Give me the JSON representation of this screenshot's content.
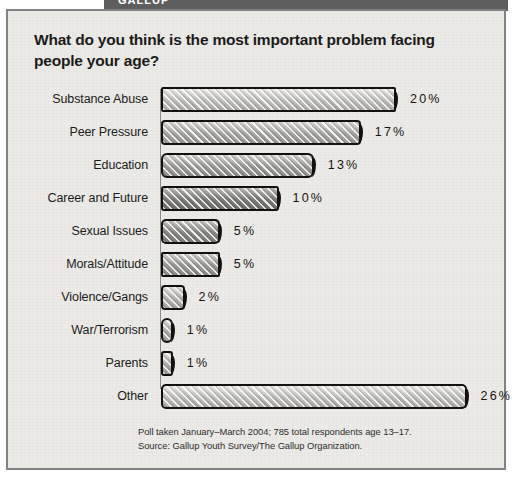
{
  "banner": {
    "text": "GALLUP"
  },
  "panel": {
    "title": "What do you think is the most important problem facing people your age?",
    "footnote_line1": "Poll taken January–March 2004; 785 total respondents age 13–17.",
    "footnote_line2": "Source: Gallup Youth Survey/The Gallup Organization."
  },
  "colors": {
    "paper": "#eceae6",
    "panel_border": "#828282",
    "banner": "#5d5d5d",
    "ink": "#14100d",
    "axis": "#8d8d8d"
  },
  "chart_data": {
    "type": "bar",
    "orientation": "horizontal",
    "title": "What do you think is the most important problem facing people your age?",
    "xlabel": "",
    "ylabel": "",
    "xlim": [
      0,
      26
    ],
    "grid": false,
    "legend": null,
    "value_suffix": "%",
    "categories": [
      "Substance Abuse",
      "Peer Pressure",
      "Education",
      "Career and Future",
      "Sexual Issues",
      "Morals/Attitude",
      "Violence/Gangs",
      "War/Terrorism",
      "Parents",
      "Other"
    ],
    "values": [
      20,
      17,
      13,
      10,
      5,
      5,
      2,
      1,
      1,
      26
    ],
    "value_labels": [
      "20%",
      "17%",
      "13%",
      "10%",
      "5%",
      "5%",
      "2%",
      "1%",
      "1%",
      "26%"
    ],
    "bar_shades": [
      "#d8d6d2",
      "#bdbbb7",
      "#b2b0ac",
      "#8d8b88",
      "#9b9995",
      "#aeaca8",
      "#cbc9c5",
      "#c4c2be",
      "#c4c2be",
      "#d8d6d2"
    ],
    "annotations": [
      "Poll taken January–March 2004; 785 total respondents age 13–17.",
      "Source: Gallup Youth Survey/The Gallup Organization."
    ]
  }
}
